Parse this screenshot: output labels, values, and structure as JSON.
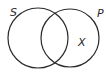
{
  "diagram": {
    "type": "venn",
    "sets": [
      {
        "id": "S",
        "label": "S"
      },
      {
        "id": "P",
        "label": "P"
      }
    ],
    "marks": [
      {
        "label": "X",
        "region": "P-only"
      }
    ],
    "stroke_color": "#2a2a2a",
    "background": "#ffffff"
  }
}
